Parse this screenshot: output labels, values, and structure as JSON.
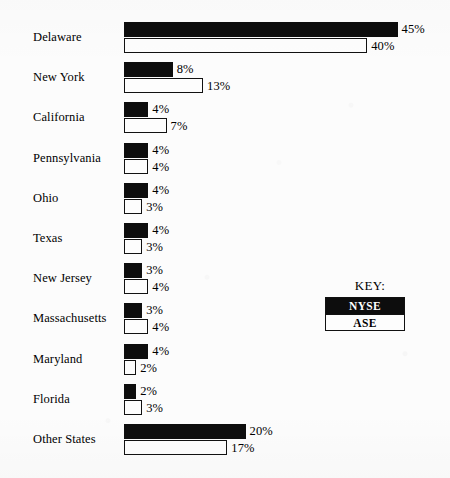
{
  "chart_data": {
    "type": "bar",
    "orientation": "horizontal",
    "title": "",
    "subtitle": "",
    "xlabel": "",
    "ylabel": "",
    "xlim": [
      0,
      45
    ],
    "grid": false,
    "legend_position": "right",
    "legend_title": "KEY:",
    "value_suffix": "%",
    "categories": [
      "Delaware",
      "New York",
      "California",
      "Pennsylvania",
      "Ohio",
      "Texas",
      "New Jersey",
      "Massachusetts",
      "Maryland",
      "Florida",
      "Other States"
    ],
    "series": [
      {
        "name": "NYSE",
        "color": "#0d0d0d",
        "values": [
          45,
          8,
          4,
          4,
          4,
          4,
          3,
          3,
          4,
          2,
          20
        ],
        "labels": [
          "45%",
          "8%",
          "4%",
          "4%",
          "4%",
          "4%",
          "3%",
          "3%",
          "4%",
          "2%",
          "20%"
        ]
      },
      {
        "name": "ASE",
        "color": "#ffffff",
        "values": [
          40,
          13,
          7,
          4,
          3,
          3,
          4,
          4,
          2,
          3,
          17
        ],
        "labels": [
          "40%",
          "13%",
          "7%",
          "4%",
          "3%",
          "3%",
          "4%",
          "4%",
          "2%",
          "3%",
          "17%"
        ]
      }
    ]
  },
  "legend": {
    "title": "KEY:",
    "items": [
      {
        "label": "NYSE",
        "swatch": "solid-black"
      },
      {
        "label": "ASE",
        "swatch": "outline-white"
      }
    ]
  }
}
